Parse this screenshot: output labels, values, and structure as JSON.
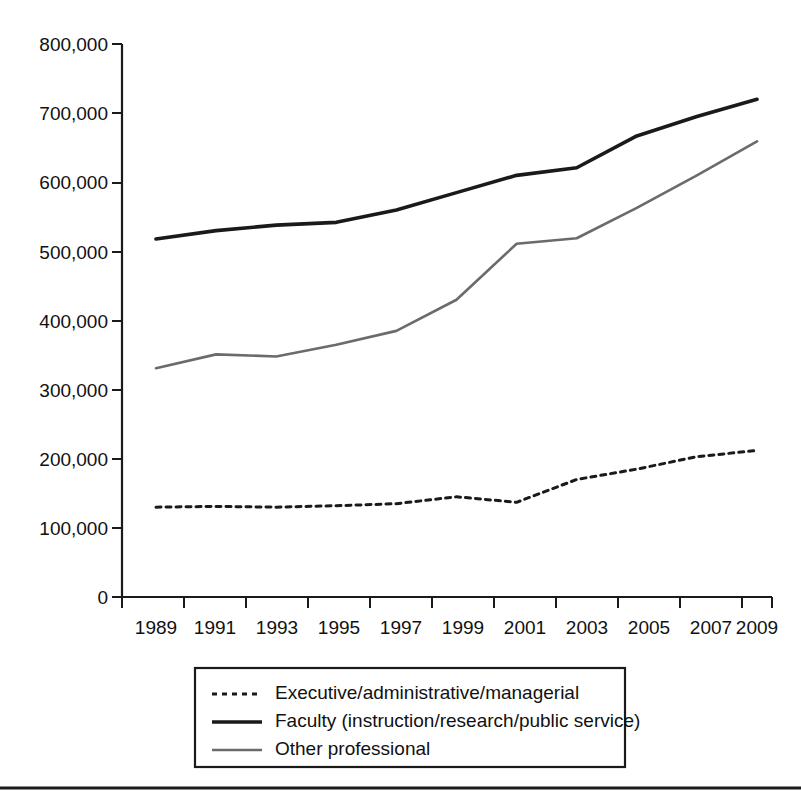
{
  "chart_data": {
    "type": "line",
    "title": "",
    "subtitle": "",
    "xlabel": "",
    "ylabel": "",
    "x": [
      1989,
      1991,
      1993,
      1995,
      1997,
      1999,
      2001,
      2003,
      2005,
      2007,
      2009
    ],
    "xticklabels": [
      "1989",
      "1991",
      "1993",
      "1995",
      "1997",
      "1999",
      "2001",
      "2003",
      "2005",
      "2007",
      "2009"
    ],
    "yticks": [
      0,
      100000,
      200000,
      300000,
      400000,
      500000,
      600000,
      700000,
      800000
    ],
    "yticklabels": [
      "0",
      "100,000",
      "200,000",
      "300,000",
      "400,000",
      "500,000",
      "600,000",
      "700,000",
      "800,000"
    ],
    "ylim": [
      0,
      800000
    ],
    "xlim": [
      1989,
      2009
    ],
    "grid": false,
    "legend_position": "below-axes",
    "series": [
      {
        "name": "Executive/administrative/managerial",
        "style": "dotted",
        "color": "#1a1a1a",
        "width": 3,
        "values": [
          130000,
          131000,
          130000,
          132000,
          135000,
          145000,
          137000,
          170000,
          185000,
          203000,
          212000
        ]
      },
      {
        "name": "Faculty (instruction/research/public service)",
        "style": "solid",
        "color": "#1a1a1a",
        "width": 3.6,
        "values": [
          518000,
          530000,
          538000,
          542000,
          560000,
          585000,
          610000,
          621000,
          667000,
          695000,
          720000
        ]
      },
      {
        "name": "Other professional",
        "style": "solid",
        "color": "#6b6b6b",
        "width": 2.6,
        "values": [
          331000,
          351000,
          348000,
          365000,
          385000,
          430000,
          511000,
          519000,
          563000,
          610000,
          659000
        ]
      }
    ]
  },
  "legend": {
    "items": [
      {
        "label": "Executive/administrative/managerial"
      },
      {
        "label": "Faculty (instruction/research/public service)"
      },
      {
        "label": "Other professional"
      }
    ]
  },
  "axes": {
    "y_axis_name": "y-axis",
    "x_axis_name": "x-axis"
  }
}
